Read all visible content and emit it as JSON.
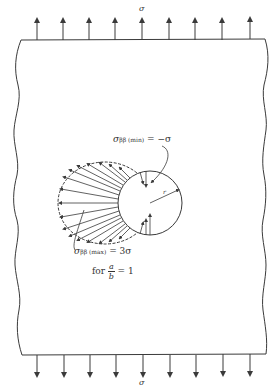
{
  "figure": {
    "applied_stress_top": "σ",
    "applied_stress_bottom": "σ",
    "min_stress": {
      "symbol": "σ",
      "subscript": "ββ (min)",
      "equals": " = −σ"
    },
    "max_stress": {
      "symbol": "σ",
      "subscript": "ββ (max)",
      "equals": " = 3σ"
    },
    "ratio": {
      "prefix": "for ",
      "numerator": "a",
      "denominator": "b",
      "equals": " = 1"
    },
    "radius_label": "r",
    "arrow_count_top": 9,
    "arrow_count_bottom": 9,
    "colors": {
      "line": "#3a3a3a",
      "background": "#ffffff"
    }
  }
}
